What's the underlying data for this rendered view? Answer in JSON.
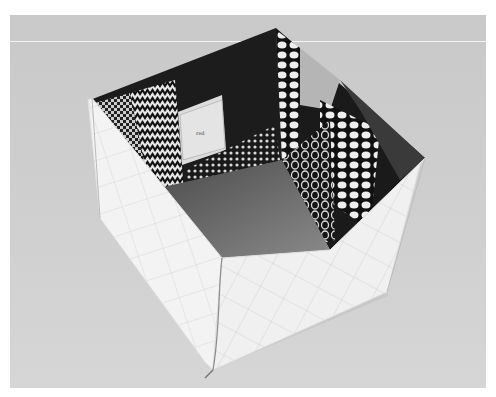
{
  "image": {
    "subject": "Quilted fabric box, open top, photographed from above",
    "colors": {
      "background": "#cccccc",
      "exterior_fabric": "#f2f2f2",
      "interior_dark": "#1a1a1a",
      "interior_floor": "#6e6e6e",
      "highlight_line": "#f4f4f4"
    },
    "label_text": "red"
  }
}
